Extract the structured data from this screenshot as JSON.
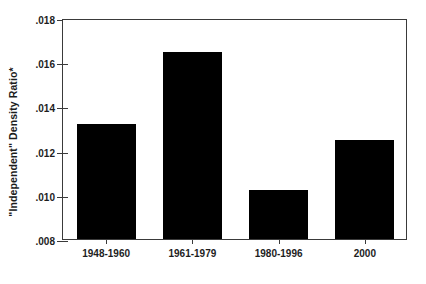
{
  "chart_data": {
    "type": "bar",
    "title": "",
    "xlabel": "",
    "ylabel": "\"Independent\" Density Ratio*",
    "categories": [
      "1948-1960",
      "1961-1979",
      "1980-1996",
      "2000"
    ],
    "values": [
      0.0132,
      0.01645,
      0.0102,
      0.0125
    ],
    "ylim": [
      0.008,
      0.018
    ],
    "ytick_labels": [
      ".018",
      ".016",
      ".014",
      ".012",
      ".010",
      ".008"
    ],
    "ytick_values": [
      0.018,
      0.016,
      0.014,
      0.012,
      0.01,
      0.008
    ],
    "grid": false,
    "legend": null,
    "bar_color": "#000000",
    "axis_color": "#3a3a3a",
    "background": "#ffffff"
  }
}
